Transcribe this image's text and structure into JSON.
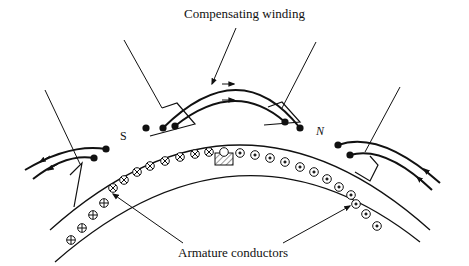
{
  "diagram": {
    "type": "electrical-machine-cross-section",
    "labels": {
      "top": "Compensating winding",
      "bottom": "Armature conductors",
      "pole_south": "S",
      "pole_north": "N"
    },
    "conductors": {
      "cross_symbol_meaning": "current into page",
      "dot_symbol_meaning": "current out of page",
      "neutral_symbol": "empty circle under interpole",
      "left_sequence": [
        "cross",
        "cross",
        "cross",
        "cross",
        "cross",
        "cross",
        "cross",
        "cross",
        "cross",
        "cross",
        "cross"
      ],
      "center": "empty",
      "right_sequence": [
        "dot",
        "dot",
        "dot",
        "dot",
        "dot",
        "dot",
        "dot",
        "dot",
        "dot",
        "dot",
        "dot",
        "dot"
      ]
    },
    "colors": {
      "stroke": "#111111",
      "background": "#ffffff",
      "hatch": "#555555"
    }
  }
}
